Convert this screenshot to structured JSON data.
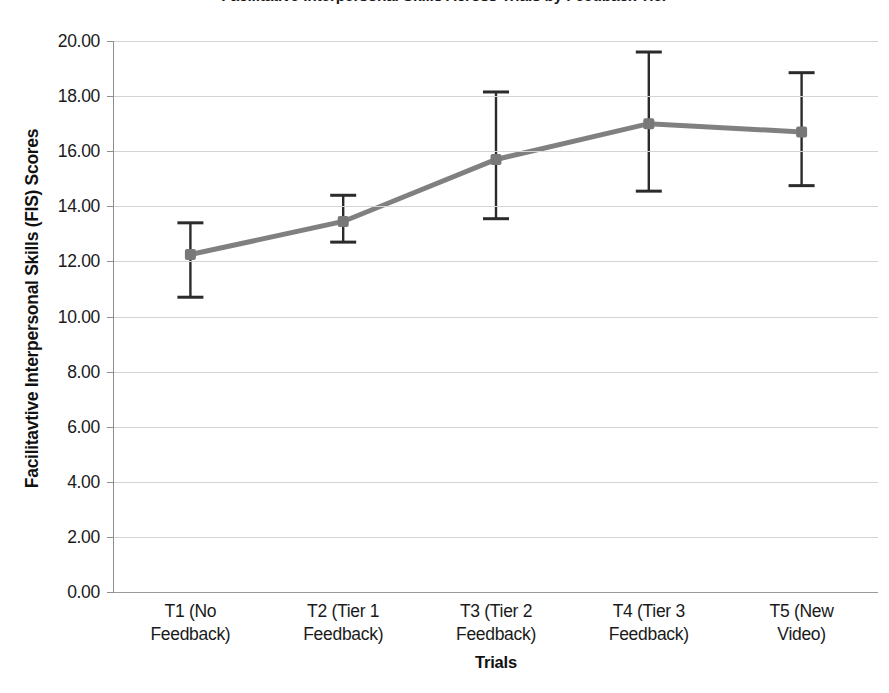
{
  "chart_data": {
    "type": "line",
    "title": "Facilitative Interpersonal Skills Across Trials by Feedback Tier",
    "xlabel": "Trials",
    "ylabel": "Facilitavtive Interpersonal Skills (FIS) Scores",
    "categories": [
      "T1 (No Feedback)",
      "T2 (Tier 1 Feedback)",
      "T3 (Tier 2 Feedback)",
      "T4 (Tier 3 Feedback)",
      "T5 (New Video)"
    ],
    "category_lines": [
      [
        "T1 (No",
        "Feedback)"
      ],
      [
        "T2 (Tier 1",
        "Feedback)"
      ],
      [
        "T3 (Tier 2",
        "Feedback)"
      ],
      [
        "T4 (Tier 3",
        "Feedback)"
      ],
      [
        "T5 (New",
        "Video)"
      ]
    ],
    "values": [
      12.25,
      13.45,
      15.7,
      17.0,
      16.7
    ],
    "error_upper": [
      13.4,
      14.4,
      18.15,
      19.6,
      18.85
    ],
    "error_lower": [
      10.7,
      12.7,
      13.55,
      14.55,
      14.75
    ],
    "ylim": [
      0,
      20
    ],
    "ytick_step": 2,
    "ytick_labels": [
      "0.00",
      "2.00",
      "4.00",
      "6.00",
      "8.00",
      "10.00",
      "12.00",
      "14.00",
      "16.00",
      "18.00",
      "20.00"
    ],
    "ytick_values": [
      0,
      2,
      4,
      6,
      8,
      10,
      12,
      14,
      16,
      18,
      20
    ],
    "grid": true,
    "legend": false,
    "series_name": "FIS Score",
    "colors": {
      "line": "#808080",
      "marker": "#787878",
      "error_bar": "#2b2b2b",
      "gridline": "#d4d4d4",
      "axis": "#8e8e8e",
      "text": "#1a1a1a"
    }
  }
}
